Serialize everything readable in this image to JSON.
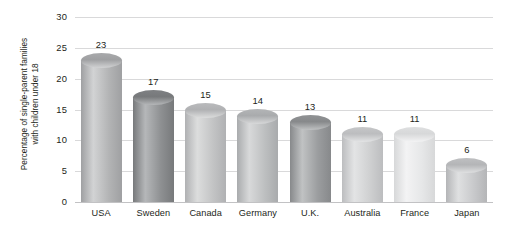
{
  "chart_data": {
    "type": "bar",
    "title": "",
    "xlabel": "",
    "ylabel": "Percentage of single-parent families with children under 18",
    "ylabel_lines": [
      "Percentage of single-parent families",
      "with children under 18"
    ],
    "categories": [
      "USA",
      "Sweden",
      "Canada",
      "Germany",
      "U.K.",
      "Australia",
      "France",
      "Japan"
    ],
    "values": [
      23,
      17,
      15,
      14,
      13,
      11,
      11,
      6
    ],
    "value_labels": [
      "23",
      "17",
      "15",
      "14",
      "13",
      "11",
      "11",
      "6"
    ],
    "ylim": [
      0,
      30
    ],
    "yticks": [
      0,
      5,
      10,
      15,
      20,
      25,
      30
    ],
    "ytick_labels": [
      "0",
      "5",
      "10",
      "15",
      "20",
      "25",
      "30"
    ],
    "grid": true,
    "legend": "none",
    "bar_colors": [
      "#b3b4b5",
      "#8e9092",
      "#c3c4c5",
      "#bdbfc0",
      "#9b9d9f",
      "#cfd0d1",
      "#e6e7e8",
      "#c8c9cb"
    ],
    "bar_colors_light": [
      "#d2d3d4",
      "#b5b7b9",
      "#dcdddd",
      "#d8d9da",
      "#c0c2c3",
      "#e3e4e5",
      "#f3f3f4",
      "#dfe0e1"
    ],
    "bar_colors_dark": [
      "#9fa0a2",
      "#77797b",
      "#b0b1b3",
      "#a9abad",
      "#87898b",
      "#bcbdbf",
      "#d7d8d9",
      "#b4b5b7"
    ],
    "cap_colors": [
      "#a8a9ab",
      "#7e8083",
      "#b9babc",
      "#b3b5b6",
      "#909294",
      "#c6c7c8",
      "#dedfe0",
      "#bfc0c2"
    ],
    "grid_color": "#d9d9da",
    "axis_color": "#c2c2c4",
    "text_color": "#231f20",
    "background": "#ffffff"
  }
}
